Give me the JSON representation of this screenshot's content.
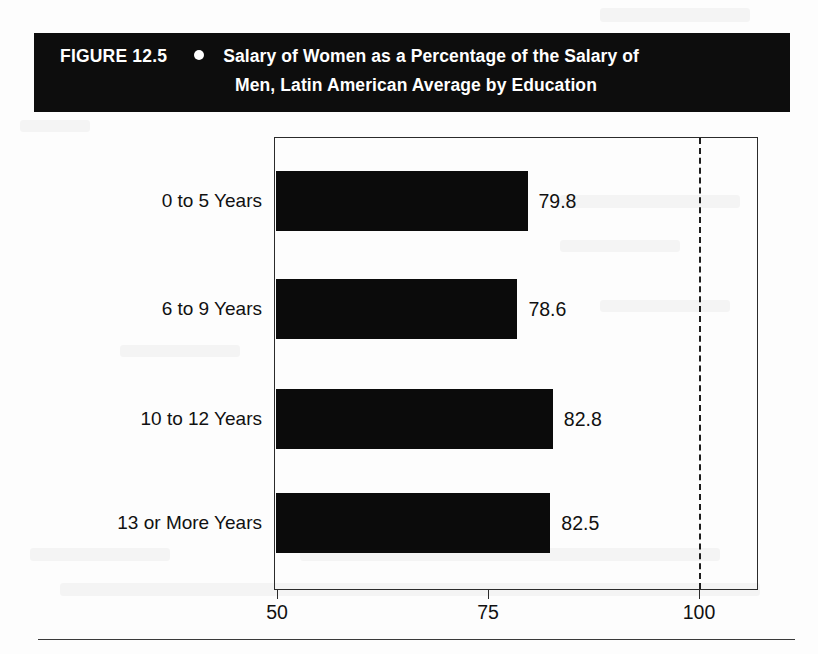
{
  "figure": {
    "number_label": "FIGURE 12.5",
    "bullet_icon": "filled-circle-bullet",
    "title_line_1": "Salary of Women as a Percentage of the Salary of",
    "title_line_2": "Men, Latin American Average by Education",
    "banner_background": "#0d0d0d",
    "banner_text_color": "#ffffff"
  },
  "chart_data": {
    "type": "bar",
    "orientation": "horizontal",
    "title": "Salary of Women as a Percentage of the Salary of Men, Latin American Average by Education",
    "categories": [
      "0 to 5 Years",
      "6 to 9 Years",
      "10 to 12 Years",
      "13 or More Years"
    ],
    "values": [
      79.8,
      78.6,
      82.8,
      82.5
    ],
    "value_labels": [
      "79.8",
      "78.6",
      "82.8",
      "82.5"
    ],
    "xlabel": "",
    "ylabel": "",
    "xlim": [
      50,
      108
    ],
    "xticks": [
      50,
      75,
      100
    ],
    "xtick_labels": [
      "50",
      "75",
      "100"
    ],
    "grid": false,
    "legend": "none",
    "bar_color": "#0b0b0b",
    "reference_line": {
      "value": 100,
      "style": "dashed",
      "color": "#1d1d1d"
    }
  }
}
